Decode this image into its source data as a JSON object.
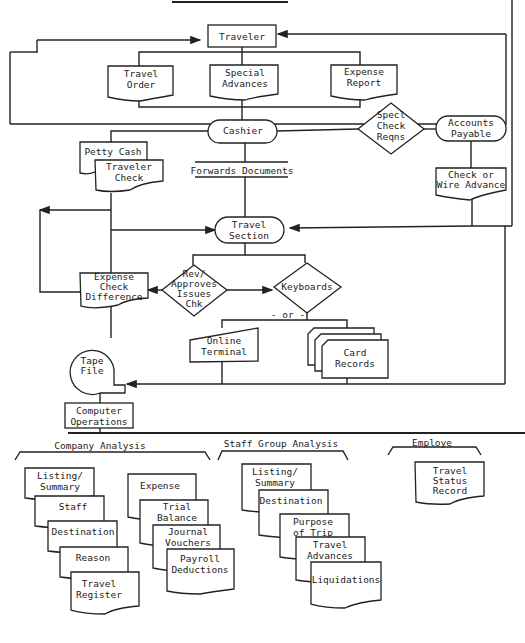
{
  "diagram": {
    "type": "flowchart",
    "nodes": {
      "traveler": "Traveler",
      "travel_order": [
        "Travel",
        "Order"
      ],
      "special_advances": [
        "Special",
        "Advances"
      ],
      "expense_report": [
        "Expense",
        "Report"
      ],
      "cashier": "Cashier",
      "specl_check_reqns": [
        "Specl",
        "Check",
        "Reqns"
      ],
      "accounts_payable": [
        "Accounts",
        "Payable"
      ],
      "check_or_wire": [
        "Check or",
        "Wire Advance"
      ],
      "petty_cash": "Petty Cash",
      "traveler_check": [
        "Traveler",
        "Check"
      ],
      "forwards_documents": "Forwards Documents",
      "travel_section": [
        "Travel",
        "Section"
      ],
      "expense_check_difference": [
        "Expense",
        "Check",
        "Difference"
      ],
      "rev_approves": [
        "Rev/",
        "Approves",
        "Issues",
        "Chk"
      ],
      "keyboards": "Keyboards",
      "or_label": "- or -",
      "online_terminal": [
        "Online",
        "Terminal"
      ],
      "card_records": [
        "Card",
        "Records"
      ],
      "tape_file": [
        "Tape",
        "File"
      ],
      "computer_operations": [
        "Computer",
        "Operations"
      ]
    },
    "groups": {
      "company_analysis": {
        "title": "Company Analysis",
        "stack_left": [
          [
            "Listing/",
            "Summary"
          ],
          [
            "Staff"
          ],
          [
            "Destination"
          ],
          [
            "Reason"
          ],
          [
            "Travel",
            "Register"
          ]
        ],
        "stack_right": [
          [
            "Expense"
          ],
          [
            "Trial",
            "Balance"
          ],
          [
            "Journal",
            "Vouchers"
          ],
          [
            "Payroll",
            "Deductions"
          ]
        ]
      },
      "staff_group_analysis": {
        "title": "Staff Group Analysis",
        "stack": [
          [
            "Listing/",
            "Summary"
          ],
          [
            "Destination"
          ],
          [
            "Purpose",
            "of Trip"
          ],
          [
            "Travel",
            "Advances"
          ],
          [
            "Liquidations"
          ]
        ]
      },
      "employe": {
        "title": "Employe",
        "stack": [
          [
            "Travel",
            "Status",
            "Record"
          ]
        ]
      }
    }
  }
}
